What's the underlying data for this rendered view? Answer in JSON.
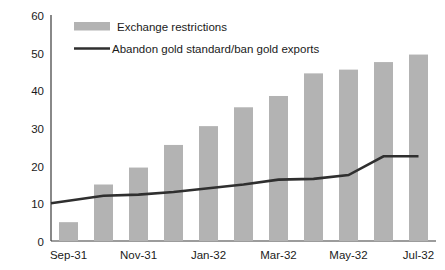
{
  "chart_data": {
    "type": "bar",
    "title": "",
    "subtitle": "",
    "xlabel": "",
    "ylabel": "",
    "ylim": [
      0,
      60
    ],
    "yticks": [
      0,
      10,
      20,
      30,
      40,
      50,
      60
    ],
    "grid": false,
    "legend_position": "top-left-inside",
    "categories": [
      "Sep-31",
      "Oct-31",
      "Nov-31",
      "Dec-31",
      "Jan-32",
      "Feb-32",
      "Mar-32",
      "Apr-32",
      "May-32",
      "Jun-32",
      "Jul-32"
    ],
    "xtick_labels": [
      "Sep-31",
      "Nov-31",
      "Jan-32",
      "Mar-32",
      "May-32",
      "Jul-32"
    ],
    "xtick_label_indices": [
      0,
      2,
      4,
      6,
      8,
      10
    ],
    "series": [
      {
        "name": "Exchange restrictions",
        "type": "bar",
        "color": "#b3b3b3",
        "values": [
          5,
          15,
          19.5,
          25.5,
          30.5,
          35.5,
          38.5,
          44.5,
          45.5,
          47.5,
          49.5
        ]
      },
      {
        "name": "Abandon gold standard/ban gold exports",
        "type": "line",
        "color": "#2f2f2f",
        "values": [
          10,
          12,
          12.3,
          13,
          14,
          15,
          16.3,
          16.5,
          17.5,
          22.5,
          22.5
        ]
      }
    ]
  },
  "legend": {
    "items": [
      {
        "label": "Exchange restrictions",
        "marker": "bar-swatch",
        "color": "#b3b3b3"
      },
      {
        "label": "Abandon gold standard/ban gold exports",
        "marker": "line-swatch",
        "color": "#2f2f2f"
      }
    ]
  },
  "axes": {
    "y_labels": [
      "60",
      "50",
      "40",
      "30",
      "20",
      "10",
      "0"
    ],
    "x_labels": [
      "Sep-31",
      "Nov-31",
      "Jan-32",
      "Mar-32",
      "May-32",
      "Jul-32"
    ]
  }
}
